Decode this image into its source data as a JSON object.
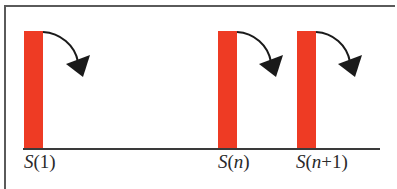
{
  "diagram": {
    "colors": {
      "bar": "#ee3b24",
      "arrow": "#1a1a1a",
      "frame": "#5a5a5a",
      "baseline": "#3a3a3a",
      "label": "#2a2a2a"
    },
    "items": [
      {
        "id": "s1",
        "symbol": "S",
        "open": "(",
        "arg": "1",
        "arg_italic": false,
        "close": ")",
        "x": 24
      },
      {
        "id": "sn",
        "symbol": "S",
        "open": "(",
        "arg": "n",
        "arg_italic": true,
        "close": ")",
        "x": 218
      },
      {
        "id": "sn1",
        "symbol": "S",
        "open": "(",
        "arg_var": "n",
        "arg_rest": "+1",
        "close": ")",
        "x": 297
      }
    ]
  }
}
